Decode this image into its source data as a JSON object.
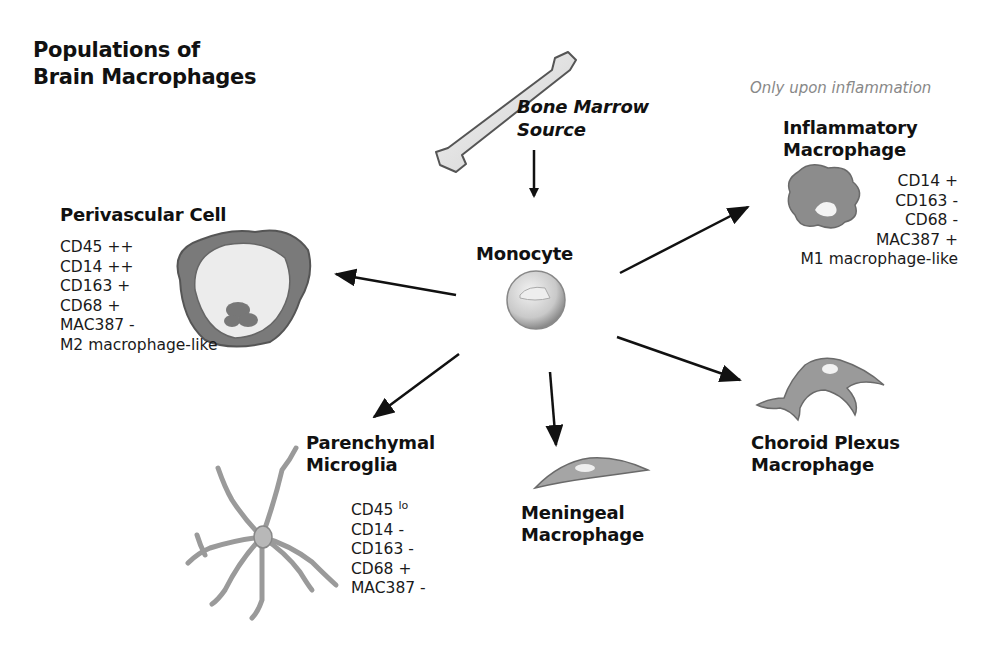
{
  "title": {
    "line1": "Populations of",
    "line2": "Brain Macrophages"
  },
  "source": {
    "line1": "Bone Marrow",
    "line2": "Source",
    "icon": "bone-icon"
  },
  "center": {
    "label": "Monocyte",
    "icon": "monocyte-cell-icon"
  },
  "colors": {
    "arrow": "#111111",
    "cell_gray": "#9a9a9a",
    "cell_light": "#d8d8d8",
    "note_gray": "#888888"
  },
  "populations": [
    {
      "id": "perivascular",
      "name": "Perivascular Cell",
      "icon": "perivascular-cell-icon",
      "markers": [
        "CD45 ++",
        "CD14 ++",
        "CD163 +",
        "CD68 +",
        "MAC387 -",
        "M2 macrophage-like"
      ]
    },
    {
      "id": "inflammatory",
      "note": "Only upon inflammation",
      "name_line1": "Inflammatory",
      "name_line2": "Macrophage",
      "icon": "inflammatory-macrophage-icon",
      "markers": [
        "CD14 +",
        "CD163 -",
        "CD68 -",
        "MAC387 +",
        "M1 macrophage-like"
      ]
    },
    {
      "id": "parenchymal",
      "name_line1": "Parenchymal",
      "name_line2": "Microglia",
      "icon": "microglia-icon",
      "markers": [
        "CD45",
        "CD14 -",
        "CD163 -",
        "CD68 +",
        "MAC387 -"
      ],
      "first_marker_superscript": "lo"
    },
    {
      "id": "meningeal",
      "name_line1": "Meningeal",
      "name_line2": "Macrophage",
      "icon": "meningeal-macrophage-icon"
    },
    {
      "id": "choroid",
      "name_line1": "Choroid Plexus",
      "name_line2": "Macrophage",
      "icon": "choroid-plexus-macrophage-icon"
    }
  ]
}
